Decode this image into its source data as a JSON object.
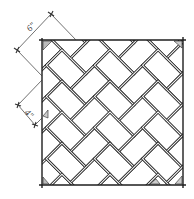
{
  "diagram": {
    "pattern": "herringbone-45deg",
    "colors": {
      "ink": "#2a2a2a",
      "joint_light": "#ffffff",
      "background": "#ffffff"
    },
    "frame": {
      "x": 42,
      "y": 40,
      "width": 141,
      "height": 145
    },
    "brick": {
      "length_px": 34,
      "width_px": 22,
      "rotation_deg": 45,
      "origin_x": 110,
      "origin_y": 112
    },
    "dimensions": [
      {
        "label": "6\"",
        "meaning": "brick length",
        "from": [
          17,
          50
        ],
        "to": [
          51,
          14
        ],
        "label_pos": [
          32,
          30
        ],
        "label_rot": -45
      },
      {
        "label": "4\"",
        "meaning": "brick width",
        "from": [
          18,
          105
        ],
        "to": [
          35,
          125
        ],
        "label_pos": [
          23,
          116
        ],
        "label_rot": 45
      }
    ]
  }
}
